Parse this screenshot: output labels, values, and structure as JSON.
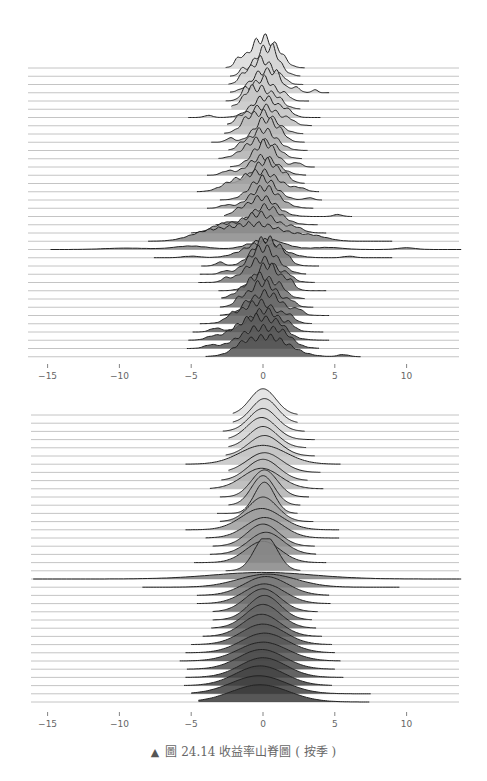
{
  "chart_data": [
    {
      "type": "ridgeline",
      "title": "",
      "xlabel": "",
      "ylabel": "",
      "x_ticks": [
        -15,
        -10,
        -5,
        0,
        5,
        10
      ],
      "xlim": [
        -16,
        14
      ],
      "grid": false,
      "n_rows": 36,
      "fill_gradient": [
        "#d9d9d9",
        "#555555"
      ],
      "description": "Return-rate distributions (raw, jagged densities) stacked by period, centered near 0",
      "rows": [
        {
          "c": 0.0,
          "s": 0.9,
          "lo": -2.6,
          "hi": 2.9,
          "h": 3.6,
          "bumps": [
            [
              -1.7,
              0.25,
              0.6
            ],
            [
              1.2,
              0.4,
              0.5
            ]
          ]
        },
        {
          "c": 0.2,
          "s": 0.8,
          "lo": -2.3,
          "hi": 2.6,
          "h": 3.3,
          "bumps": [
            [
              -1.5,
              0.2,
              0.5
            ],
            [
              0.8,
              0.3,
              0.6
            ]
          ]
        },
        {
          "c": -0.1,
          "s": 0.8,
          "lo": -2.4,
          "hi": 2.8,
          "h": 3.0,
          "bumps": [
            [
              -1.4,
              0.3,
              0.6
            ],
            [
              1.4,
              0.3,
              0.5
            ]
          ]
        },
        {
          "c": 0.1,
          "s": 0.9,
          "lo": -2.3,
          "hi": 4.6,
          "h": 2.6,
          "bumps": [
            [
              1.0,
              0.3,
              0.9
            ],
            [
              2.3,
              0.3,
              0.6
            ],
            [
              3.6,
              0.2,
              0.4
            ]
          ]
        },
        {
          "c": 0.0,
          "s": 0.8,
          "lo": -2.6,
          "hi": 3.2,
          "h": 2.7,
          "bumps": [
            [
              -1.3,
              0.25,
              0.8
            ],
            [
              1.6,
              0.3,
              0.6
            ]
          ]
        },
        {
          "c": -0.2,
          "s": 1.0,
          "lo": -2.2,
          "hi": 2.6,
          "h": 2.5,
          "bumps": [
            [
              -1.0,
              0.3,
              0.7
            ],
            [
              1.1,
              0.3,
              0.5
            ]
          ]
        },
        {
          "c": 0.1,
          "s": 0.9,
          "lo": -5.2,
          "hi": 4.0,
          "h": 2.4,
          "bumps": [
            [
              -3.8,
              0.3,
              0.3
            ],
            [
              1.7,
              0.4,
              0.7
            ]
          ]
        },
        {
          "c": 0.0,
          "s": 1.1,
          "lo": -2.5,
          "hi": 3.4,
          "h": 2.3,
          "bumps": [
            [
              -1.6,
              0.3,
              0.7
            ],
            [
              1.9,
              0.3,
              0.5
            ]
          ]
        },
        {
          "c": -0.1,
          "s": 1.0,
          "lo": -2.7,
          "hi": 2.8,
          "h": 2.6,
          "bumps": [
            [
              -1.2,
              0.3,
              0.6
            ]
          ]
        },
        {
          "c": 0.2,
          "s": 0.8,
          "lo": -3.6,
          "hi": 2.9,
          "h": 2.8,
          "bumps": [
            [
              -2.3,
              0.3,
              0.5
            ],
            [
              1.3,
              0.3,
              0.4
            ]
          ]
        },
        {
          "c": 0.0,
          "s": 0.9,
          "lo": -2.4,
          "hi": 3.1,
          "h": 2.5,
          "bumps": [
            [
              -1.5,
              0.3,
              0.5
            ]
          ]
        },
        {
          "c": -0.3,
          "s": 1.0,
          "lo": -3.1,
          "hi": 2.7,
          "h": 2.3,
          "bumps": [
            [
              1.0,
              0.4,
              0.5
            ]
          ]
        },
        {
          "c": 0.1,
          "s": 0.8,
          "lo": -2.3,
          "hi": 3.6,
          "h": 2.9,
          "bumps": [
            [
              2.4,
              0.3,
              0.5
            ]
          ]
        },
        {
          "c": 0.0,
          "s": 1.0,
          "lo": -3.9,
          "hi": 3.0,
          "h": 2.2,
          "bumps": [
            [
              -2.5,
              0.4,
              0.6
            ]
          ]
        },
        {
          "c": 0.2,
          "s": 0.9,
          "lo": -2.6,
          "hi": 2.9,
          "h": 2.7,
          "bumps": [
            [
              1.6,
              0.3,
              0.5
            ]
          ]
        },
        {
          "c": -0.1,
          "s": 1.2,
          "lo": -4.6,
          "hi": 3.9,
          "h": 2.4,
          "bumps": [
            [
              -2.2,
              0.8,
              1.0
            ],
            [
              2.6,
              0.4,
              0.4
            ]
          ]
        },
        {
          "c": 0.0,
          "s": 0.9,
          "lo": -3.0,
          "hi": 4.1,
          "h": 2.6,
          "bumps": [
            [
              3.2,
              0.3,
              0.3
            ]
          ]
        },
        {
          "c": 0.1,
          "s": 1.0,
          "lo": -3.9,
          "hi": 3.5,
          "h": 2.5,
          "bumps": [
            [
              -2.6,
              0.4,
              0.4
            ]
          ]
        },
        {
          "c": -0.1,
          "s": 1.0,
          "lo": -2.7,
          "hi": 6.2,
          "h": 2.3,
          "bumps": [
            [
              5.2,
              0.3,
              0.3
            ],
            [
              -1.8,
              0.4,
              0.5
            ]
          ]
        },
        {
          "c": 0.2,
          "s": 1.0,
          "lo": -3.3,
          "hi": 3.8,
          "h": 2.2,
          "bumps": [
            [
              -2.4,
              0.3,
              0.4
            ]
          ]
        },
        {
          "c": -0.3,
          "s": 1.3,
          "lo": -5.0,
          "hi": 4.4,
          "h": 2.3,
          "bumps": [
            [
              -3.0,
              0.7,
              1.0
            ],
            [
              2.3,
              0.5,
              0.6
            ]
          ]
        },
        {
          "c": -0.6,
          "s": 2.0,
          "lo": -8.0,
          "hi": 9.0,
          "h": 2.1,
          "bumps": [
            [
              -4.0,
              1.2,
              1.1
            ],
            [
              3.5,
              1.0,
              0.7
            ]
          ]
        },
        {
          "c": 0.3,
          "s": 1.2,
          "lo": -14.8,
          "hi": 13.8,
          "h": 1.2,
          "bumps": [
            [
              -9.5,
              1.5,
              0.4
            ],
            [
              -5.0,
              1.2,
              1.0
            ],
            [
              4.5,
              1.0,
              0.6
            ],
            [
              10.0,
              0.6,
              0.5
            ]
          ]
        },
        {
          "c": 0.0,
          "s": 1.3,
          "lo": -7.6,
          "hi": 9.0,
          "h": 1.8,
          "bumps": [
            [
              -5.0,
              0.6,
              0.3
            ],
            [
              6.0,
              0.4,
              0.3
            ]
          ]
        },
        {
          "c": 0.2,
          "s": 0.9,
          "lo": -4.3,
          "hi": 3.9,
          "h": 3.3,
          "bumps": [
            [
              -3.0,
              0.3,
              0.4
            ],
            [
              1.5,
              0.4,
              0.6
            ]
          ]
        },
        {
          "c": 0.0,
          "s": 1.0,
          "lo": -4.4,
          "hi": 3.0,
          "h": 3.2,
          "bumps": [
            [
              -2.7,
              0.3,
              0.3
            ]
          ]
        },
        {
          "c": -0.1,
          "s": 1.1,
          "lo": -4.5,
          "hi": 3.6,
          "h": 2.8,
          "bumps": [
            [
              -2.6,
              0.3,
              0.4
            ],
            [
              1.8,
              0.3,
              0.5
            ]
          ]
        },
        {
          "c": 0.3,
          "s": 0.9,
          "lo": -3.1,
          "hi": 4.4,
          "h": 3.1,
          "bumps": [
            [
              1.9,
              0.3,
              0.7
            ]
          ]
        },
        {
          "c": -0.2,
          "s": 1.1,
          "lo": -2.9,
          "hi": 2.9,
          "h": 2.8,
          "bumps": [
            [
              1.3,
              0.3,
              0.6
            ]
          ]
        },
        {
          "c": 0.0,
          "s": 1.0,
          "lo": -3.0,
          "hi": 3.5,
          "h": 3.0,
          "bumps": [
            [
              -1.7,
              0.3,
              0.5
            ],
            [
              2.0,
              0.3,
              0.5
            ]
          ]
        },
        {
          "c": 0.2,
          "s": 1.1,
          "lo": -3.0,
          "hi": 4.6,
          "h": 2.7,
          "bumps": [
            [
              -1.2,
              0.3,
              0.5
            ],
            [
              2.5,
              0.3,
              0.6
            ]
          ]
        },
        {
          "c": -0.3,
          "s": 1.2,
          "lo": -4.4,
          "hi": 3.4,
          "h": 2.6,
          "bumps": [
            [
              -2.2,
              0.4,
              0.6
            ],
            [
              1.8,
              0.4,
              0.7
            ]
          ]
        },
        {
          "c": 0.1,
          "s": 1.1,
          "lo": -4.9,
          "hi": 4.2,
          "h": 2.6,
          "bumps": [
            [
              -3.3,
              0.4,
              0.5
            ],
            [
              1.9,
              0.3,
              0.5
            ]
          ]
        },
        {
          "c": -0.5,
          "s": 1.4,
          "lo": -5.2,
          "hi": 4.6,
          "h": 2.8,
          "bumps": [
            [
              -3.6,
              0.4,
              0.3
            ],
            [
              1.2,
              0.5,
              0.8
            ]
          ]
        },
        {
          "c": -0.2,
          "s": 1.4,
          "lo": -5.3,
          "hi": 3.9,
          "h": 2.5,
          "bumps": [
            [
              -3.7,
              0.4,
              0.4
            ],
            [
              1.5,
              0.6,
              0.9
            ]
          ]
        },
        {
          "c": 0.3,
          "s": 1.5,
          "lo": -4.0,
          "hi": 6.8,
          "h": 2.4,
          "bumps": [
            [
              -1.5,
              0.6,
              0.7
            ],
            [
              5.6,
              0.4,
              0.3
            ]
          ]
        }
      ]
    },
    {
      "type": "ridgeline",
      "title": "",
      "xlabel": "",
      "ylabel": "",
      "x_ticks": [
        -15,
        -10,
        -5,
        0,
        5,
        10
      ],
      "xlim": [
        -16,
        14
      ],
      "grid": false,
      "n_rows": 36,
      "fill_gradient": [
        "#e0e0e0",
        "#3a3a3a"
      ],
      "description": "Smoothed (fitted) return-rate distributions stacked by period, centered near 0",
      "rows": [
        {
          "c": 0.0,
          "s": 0.9,
          "lo": -2.1,
          "hi": 2.4,
          "h": 3.2,
          "bumps": []
        },
        {
          "c": 0.1,
          "s": 0.9,
          "lo": -2.1,
          "hi": 2.4,
          "h": 3.0,
          "bumps": []
        },
        {
          "c": 0.0,
          "s": 0.95,
          "lo": -2.8,
          "hi": 2.9,
          "h": 2.8,
          "bumps": []
        },
        {
          "c": -0.1,
          "s": 1.0,
          "lo": -2.4,
          "hi": 3.6,
          "h": 2.7,
          "bumps": []
        },
        {
          "c": 0.0,
          "s": 1.0,
          "lo": -2.4,
          "hi": 3.0,
          "h": 2.6,
          "bumps": []
        },
        {
          "c": 0.1,
          "s": 1.1,
          "lo": -2.6,
          "hi": 3.6,
          "h": 2.5,
          "bumps": []
        },
        {
          "c": 0.0,
          "s": 1.6,
          "lo": -5.4,
          "hi": 5.4,
          "h": 2.3,
          "bumps": []
        },
        {
          "c": 0.1,
          "s": 1.2,
          "lo": -2.4,
          "hi": 4.0,
          "h": 2.4,
          "bumps": []
        },
        {
          "c": 0.0,
          "s": 1.1,
          "lo": -2.9,
          "hi": 3.1,
          "h": 2.6,
          "bumps": []
        },
        {
          "c": -0.1,
          "s": 1.3,
          "lo": -3.7,
          "hi": 4.2,
          "h": 2.5,
          "bumps": []
        },
        {
          "c": 0.1,
          "s": 0.9,
          "lo": -3.0,
          "hi": 3.2,
          "h": 3.3,
          "bumps": []
        },
        {
          "c": 0.0,
          "s": 0.8,
          "lo": -2.4,
          "hi": 2.6,
          "h": 3.6,
          "bumps": []
        },
        {
          "c": 0.1,
          "s": 0.7,
          "lo": -3.2,
          "hi": 2.4,
          "h": 3.8,
          "bumps": []
        },
        {
          "c": 0.0,
          "s": 1.0,
          "lo": -3.0,
          "hi": 3.5,
          "h": 3.0,
          "bumps": []
        },
        {
          "c": -0.1,
          "s": 1.4,
          "lo": -5.4,
          "hi": 5.3,
          "h": 2.6,
          "bumps": []
        },
        {
          "c": 0.1,
          "s": 1.3,
          "lo": -4.0,
          "hi": 5.3,
          "h": 2.5,
          "bumps": []
        },
        {
          "c": 0.0,
          "s": 1.1,
          "lo": -3.5,
          "hi": 3.6,
          "h": 2.7,
          "bumps": []
        },
        {
          "c": 0.2,
          "s": 1.2,
          "lo": -3.7,
          "hi": 3.7,
          "h": 2.7,
          "bumps": []
        },
        {
          "c": 0.0,
          "s": 1.2,
          "lo": -4.8,
          "hi": 4.4,
          "h": 2.6,
          "bumps": []
        },
        {
          "c": 0.2,
          "s": 0.8,
          "lo": -2.6,
          "hi": 2.6,
          "h": 4.2,
          "bumps": []
        },
        {
          "c": 0.0,
          "s": 3.5,
          "lo": -16.0,
          "hi": 13.8,
          "h": 0.8,
          "bumps": []
        },
        {
          "c": 0.3,
          "s": 2.0,
          "lo": -8.4,
          "hi": 9.5,
          "h": 1.6,
          "bumps": []
        },
        {
          "c": 0.2,
          "s": 1.5,
          "lo": -4.6,
          "hi": 4.6,
          "h": 2.3,
          "bumps": []
        },
        {
          "c": 0.1,
          "s": 1.4,
          "lo": -4.6,
          "hi": 4.7,
          "h": 2.4,
          "bumps": []
        },
        {
          "c": 0.0,
          "s": 1.2,
          "lo": -3.5,
          "hi": 3.8,
          "h": 2.8,
          "bumps": []
        },
        {
          "c": 0.1,
          "s": 1.1,
          "lo": -3.5,
          "hi": 3.4,
          "h": 3.0,
          "bumps": []
        },
        {
          "c": 0.0,
          "s": 1.2,
          "lo": -3.6,
          "hi": 3.7,
          "h": 2.9,
          "bumps": []
        },
        {
          "c": -0.1,
          "s": 1.3,
          "lo": -4.2,
          "hi": 4.1,
          "h": 2.7,
          "bumps": []
        },
        {
          "c": 0.0,
          "s": 1.5,
          "lo": -5.0,
          "hi": 4.8,
          "h": 2.5,
          "bumps": []
        },
        {
          "c": 0.1,
          "s": 1.6,
          "lo": -5.4,
          "hi": 5.0,
          "h": 2.4,
          "bumps": []
        },
        {
          "c": 0.0,
          "s": 1.7,
          "lo": -5.8,
          "hi": 5.4,
          "h": 2.3,
          "bumps": []
        },
        {
          "c": -0.1,
          "s": 1.6,
          "lo": -5.3,
          "hi": 5.0,
          "h": 2.4,
          "bumps": []
        },
        {
          "c": 0.0,
          "s": 1.6,
          "lo": -5.4,
          "hi": 5.6,
          "h": 2.4,
          "bumps": []
        },
        {
          "c": -0.2,
          "s": 1.7,
          "lo": -5.5,
          "hi": 4.8,
          "h": 2.4,
          "bumps": []
        },
        {
          "c": -0.3,
          "s": 1.9,
          "lo": -5.0,
          "hi": 7.5,
          "h": 2.2,
          "bumps": []
        },
        {
          "c": -0.2,
          "s": 2.0,
          "lo": -4.5,
          "hi": 7.4,
          "h": 2.1,
          "bumps": []
        }
      ]
    }
  ],
  "axes": {
    "top": {
      "tick_labels": [
        "−15",
        "−10",
        "−5",
        "0",
        "5",
        "10"
      ]
    },
    "bottom": {
      "tick_labels": [
        "−15",
        "−10",
        "−5",
        "0",
        "5",
        "10"
      ]
    }
  },
  "caption": {
    "marker": "▲",
    "text": "圖 24.14 收益率山脊圖 ( 按季 )"
  }
}
